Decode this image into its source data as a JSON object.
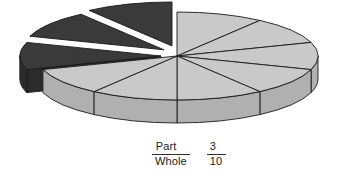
{
  "figure": {
    "title": "",
    "type": "exploded-3d-pie",
    "label": {
      "ratio": {
        "numerator": "Part",
        "denominator": "Whole"
      },
      "value": {
        "numerator": "3",
        "denominator": "10"
      }
    }
  },
  "colors": {
    "light_top": "#c9c9c9",
    "light_side": "#b0b0b0",
    "dark_top": "#3a3a3a",
    "dark_side": "#2b2b2b",
    "outline": "#1a1a1a",
    "background": "#ffffff",
    "text": "#1c1c1c"
  },
  "geometry": {
    "center_x": 177,
    "center_y": 56,
    "radius_x": 141,
    "radius_y": 44,
    "depth": 23,
    "explode_offset": 17,
    "slice_count": 10,
    "slice_angle_deg": 36,
    "start_angle_deg": -90
  },
  "chart_data": {
    "type": "pie",
    "title": "",
    "xlabel": "",
    "ylabel": "",
    "total_slices": 10,
    "categories": [
      "slice-1",
      "slice-2",
      "slice-3",
      "slice-4",
      "slice-5",
      "slice-6",
      "slice-7",
      "slice-8",
      "slice-9",
      "slice-10"
    ],
    "values": [
      1,
      1,
      1,
      1,
      1,
      1,
      1,
      1,
      1,
      1
    ],
    "fractions": [
      0.1,
      0.1,
      0.1,
      0.1,
      0.1,
      0.1,
      0.1,
      0.1,
      0.1,
      0.1
    ],
    "series": [
      {
        "name": "Whole",
        "values": [
          1,
          1,
          1,
          1,
          1,
          1,
          1,
          1,
          1,
          1
        ]
      }
    ],
    "groups": [
      {
        "name": "Part (shaded / exploded)",
        "count": 3,
        "fraction": "3/10",
        "percent": 30,
        "color": "#3a3a3a",
        "exploded": true
      },
      {
        "name": "Remainder (unshaded)",
        "count": 7,
        "fraction": "7/10",
        "percent": 70,
        "color": "#c9c9c9",
        "exploded": false
      }
    ],
    "annotations": [
      "Part/Whole",
      "3/10"
    ],
    "grid": false,
    "legend": "none"
  },
  "slices": [
    {
      "name": "slice-1",
      "index": 1,
      "shaded": false,
      "exploded": false
    },
    {
      "name": "slice-2",
      "index": 2,
      "shaded": false,
      "exploded": false
    },
    {
      "name": "slice-3",
      "index": 3,
      "shaded": false,
      "exploded": false
    },
    {
      "name": "slice-4",
      "index": 4,
      "shaded": false,
      "exploded": false
    },
    {
      "name": "slice-5",
      "index": 5,
      "shaded": false,
      "exploded": false
    },
    {
      "name": "slice-6",
      "index": 6,
      "shaded": false,
      "exploded": false
    },
    {
      "name": "slice-7",
      "index": 7,
      "shaded": false,
      "exploded": false
    },
    {
      "name": "slice-8",
      "index": 8,
      "shaded": true,
      "exploded": true
    },
    {
      "name": "slice-9",
      "index": 9,
      "shaded": true,
      "exploded": true
    },
    {
      "name": "slice-10",
      "index": 10,
      "shaded": true,
      "exploded": true
    }
  ]
}
